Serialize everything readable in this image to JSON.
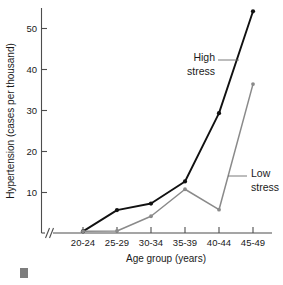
{
  "chart_data": {
    "type": "line",
    "title": "",
    "xlabel": "Age group (years)",
    "ylabel": "Hypertension (cases per thousand)",
    "categories": [
      "20-24",
      "25-29",
      "30-34",
      "35-39",
      "40-44",
      "45-49"
    ],
    "yticks": [
      10,
      20,
      30,
      40,
      50
    ],
    "ylim": [
      0,
      56
    ],
    "grid": false,
    "legend_position": "inline-annotations",
    "x_axis_break": true,
    "series": [
      {
        "name": "High stress",
        "color": "#111111",
        "values": [
          0.4,
          5.6,
          7.2,
          12.6,
          29.3,
          54.2
        ]
      },
      {
        "name": "Low stress",
        "color": "#8a8a8a",
        "values": [
          0.4,
          0.5,
          4.1,
          10.7,
          5.7,
          36.4
        ]
      }
    ],
    "annotations": [
      {
        "text_line1": "High",
        "text_line2": "stress",
        "target_series": "High stress"
      },
      {
        "text_line1": "Low",
        "text_line2": "stress",
        "target_series": "Low stress"
      }
    ]
  },
  "axis": {
    "y_title": "Hypertension (cases per thousand)",
    "x_title": "Age group (years)",
    "y_tick_labels": [
      "50",
      "40",
      "30",
      "20",
      "10"
    ],
    "x_tick_labels": [
      "20-24",
      "25-29",
      "30-34",
      "35-39",
      "40-44",
      "45-49"
    ],
    "break_symbol": "//"
  },
  "labels": {
    "high_line1": "High",
    "high_line2": "stress",
    "low_line1": "Low",
    "low_line2": "stress"
  },
  "colors": {
    "high_stress": "#111111",
    "low_stress": "#8a8a8a",
    "axis": "#4d4d4d",
    "text": "#1a1a1a"
  }
}
